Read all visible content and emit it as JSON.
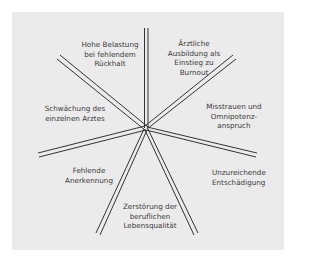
{
  "diagram": {
    "type": "radial-spokes",
    "center": "burnout-causes",
    "colors": {
      "background": "#ebebeb",
      "lines": "#333333",
      "text": "#3a3a3a"
    },
    "segments": [
      {
        "id": "aerztliche-ausbildung",
        "label": "Ärztliche\nAusbildung als\nEinstieg zu\nBurnout"
      },
      {
        "id": "misstrauen",
        "label": "Misstrauen und\nOmnipotenz-\nanspruch"
      },
      {
        "id": "entschaedigung",
        "label": "Unzureichende\nEntschädigung"
      },
      {
        "id": "lebensqualitaet",
        "label": "Zerstörung der\nberuflichen\nLebensqualität"
      },
      {
        "id": "anerkennung",
        "label": "Fehlende\nAnerkennung"
      },
      {
        "id": "schwaechung",
        "label": "Schwächung des\neinzelnen Arztes"
      },
      {
        "id": "belastung",
        "label": "Hohe Belastung\nbei fehlendem\nRückhalt"
      }
    ]
  }
}
